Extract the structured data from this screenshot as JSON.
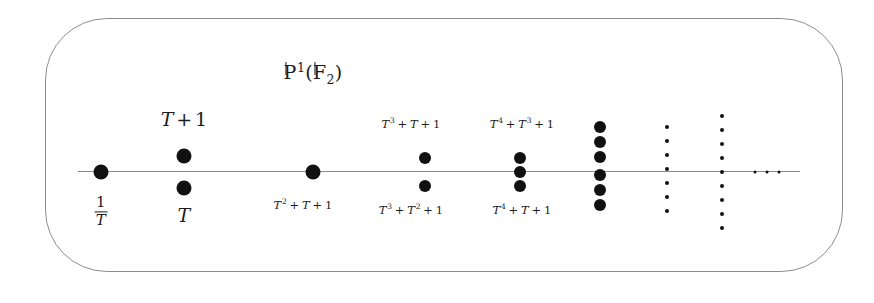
{
  "figure": {
    "title": "P1(F2)",
    "title_parts": {
      "p": "P",
      "exp": "1",
      "open": "(",
      "f": "F",
      "sub": "2",
      "close": ")"
    },
    "axis_color": "#8a8a8a",
    "dot_color": "#111111",
    "border_color": "#8e8e8e"
  },
  "labels": [
    {
      "name": "label-one-over-T",
      "text": "1/T",
      "numerator": "1",
      "denominator": "T",
      "position": "below",
      "x": 101,
      "y": 212
    },
    {
      "name": "label-T-plus-1",
      "text": "T + 1",
      "position": "above",
      "x": 184,
      "y": 119
    },
    {
      "name": "label-T",
      "text": "T",
      "position": "below",
      "x": 184,
      "y": 215
    },
    {
      "name": "label-T2-T-1",
      "text": "T^2 + T + 1",
      "position": "below",
      "x": 303,
      "y": 205
    },
    {
      "name": "label-T3-T-1",
      "text": "T^3 + T + 1",
      "position": "above",
      "x": 411,
      "y": 124
    },
    {
      "name": "label-T3-T2-1",
      "text": "T^3 + T^2 + 1",
      "position": "below",
      "x": 411,
      "y": 210
    },
    {
      "name": "label-T4-T3-1",
      "text": "T^4 + T^3 + 1",
      "position": "above",
      "x": 522,
      "y": 124
    },
    {
      "name": "label-T4-T-1",
      "text": "T^4 + T + 1",
      "position": "below",
      "x": 522,
      "y": 210
    }
  ],
  "point_columns": [
    {
      "name": "column-degree-inf",
      "label_ref": "1/T",
      "x": 101,
      "count": 1,
      "offsets": [
        0
      ],
      "size": "big"
    },
    {
      "name": "column-degree-1",
      "label_ref": "T and T+1",
      "x": 184,
      "count": 2,
      "offsets": [
        -16,
        16
      ],
      "size": "big"
    },
    {
      "name": "column-degree-2",
      "label_ref": "T^2+T+1",
      "x": 313,
      "count": 1,
      "offsets": [
        0
      ],
      "size": "big"
    },
    {
      "name": "column-degree-3",
      "label_ref": "T^3 irreducibles",
      "x": 425,
      "count": 2,
      "offsets": [
        -14,
        14
      ],
      "size": "med"
    },
    {
      "name": "column-degree-4",
      "label_ref": "T^4 irreducibles",
      "x": 520,
      "count": 3,
      "offsets": [
        -14,
        0,
        14
      ],
      "size": "med"
    },
    {
      "name": "column-degree-5",
      "label_ref": "degree 5",
      "x": 600,
      "count": 6,
      "offsets": [
        -45,
        -30,
        -15,
        3,
        18,
        33
      ],
      "size": "med"
    },
    {
      "name": "column-ellipsis-1",
      "label_ref": "continuation",
      "x": 667,
      "count": 7,
      "offsets": [
        -45,
        -31,
        -17,
        -3,
        11,
        25,
        39
      ],
      "size": "tiny"
    },
    {
      "name": "column-ellipsis-2",
      "label_ref": "continuation",
      "x": 722,
      "count": 9,
      "offsets": [
        -56,
        -42,
        -28,
        -14,
        0,
        14,
        28,
        42,
        56
      ],
      "size": "tiny"
    },
    {
      "name": "column-horizontal-ellipsis",
      "label_ref": "continues",
      "x": 767,
      "count": 3,
      "offsets": [
        0
      ],
      "size": "micro"
    }
  ],
  "horizontal_ellipsis_xs": [
    755,
    767,
    779
  ],
  "axis": {
    "name": "projective-line",
    "x_start": 78,
    "x_end": 800,
    "y": 172
  }
}
